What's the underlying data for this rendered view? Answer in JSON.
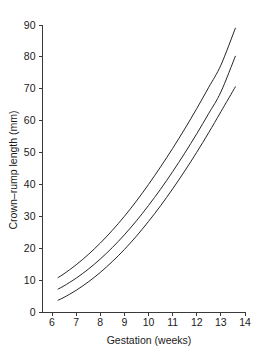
{
  "chart_data": {
    "type": "line",
    "title": "",
    "xlabel": "Gestation (weeks)",
    "ylabel": "Crown–rump length (mm)",
    "xlim": [
      5.6,
      14.2
    ],
    "ylim": [
      0,
      92
    ],
    "xticks": [
      6,
      7,
      8,
      9,
      10,
      11,
      12,
      13,
      14
    ],
    "yticks": [
      0,
      10,
      20,
      30,
      40,
      50,
      60,
      70,
      80,
      90
    ],
    "xtick_labels": [
      "6",
      "7",
      "8",
      "9",
      "10",
      "11",
      "12",
      "13",
      "14"
    ],
    "ytick_labels": [
      "0",
      "10",
      "20",
      "30",
      "40",
      "50",
      "60",
      "70",
      "80",
      "90"
    ],
    "grid": false,
    "legend": "none",
    "line_color": "#262626",
    "axis_color": "#3a3a3a",
    "background_color": "#ffffff",
    "x": [
      6.25,
      6.5,
      7.0,
      7.5,
      8.0,
      8.5,
      9.0,
      9.5,
      10.0,
      10.5,
      11.0,
      11.5,
      12.0,
      12.5,
      13.0,
      13.6
    ],
    "series": [
      {
        "name": "upper",
        "values": [
          10.8,
          12.0,
          14.8,
          18.0,
          21.6,
          25.6,
          30.0,
          34.8,
          40.0,
          45.5,
          51.3,
          57.4,
          63.8,
          70.5,
          77.4,
          89.0
        ]
      },
      {
        "name": "median",
        "values": [
          7.2,
          8.2,
          10.6,
          13.4,
          16.6,
          20.2,
          24.2,
          28.6,
          33.4,
          38.5,
          44.0,
          49.8,
          55.9,
          62.3,
          69.0,
          80.2
        ]
      },
      {
        "name": "lower",
        "values": [
          3.7,
          4.6,
          6.8,
          9.4,
          12.4,
          15.8,
          19.6,
          23.8,
          28.4,
          33.3,
          38.6,
          44.2,
          50.1,
          56.3,
          62.8,
          70.6
        ]
      }
    ]
  }
}
